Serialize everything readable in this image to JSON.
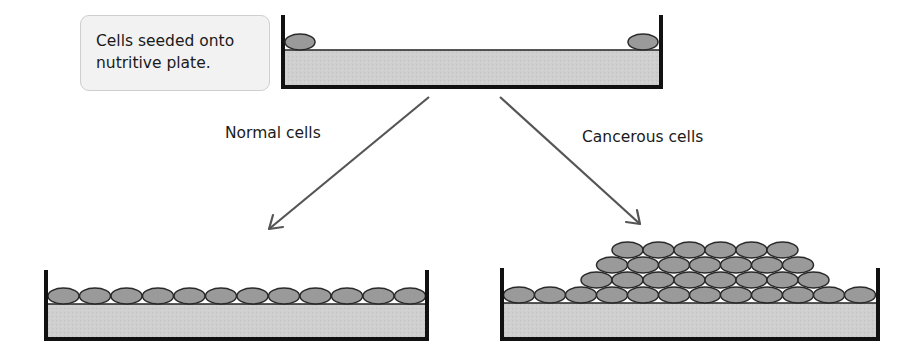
{
  "labels": {
    "seeded_line1": "Cells seeded onto",
    "seeded_line2": "nutritive plate.",
    "normal": "Normal cells",
    "cancerous": "Cancerous cells"
  },
  "colors": {
    "cell_fill": "#9a9a9a",
    "cell_outline": "#2a2a2a",
    "medium_fill": "#cfcfcf",
    "plate_wall": "#111111",
    "arrow": "#555555",
    "label_box_bg": "#f2f2f2"
  },
  "plates": {
    "top": {
      "cells": 2,
      "description": "two isolated cells at edges"
    },
    "normal": {
      "rows": [
        12
      ],
      "description": "single monolayer"
    },
    "cancerous": {
      "rows": [
        12,
        8,
        7,
        6
      ],
      "description": "stacked multilayer pile"
    }
  }
}
